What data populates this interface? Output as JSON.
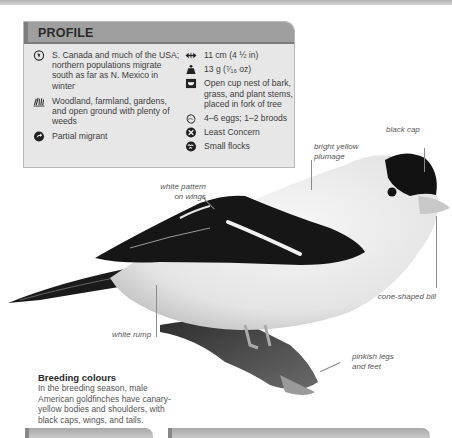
{
  "profile": {
    "title": "PROFILE",
    "left_items": [
      {
        "icon": "globe-range-icon",
        "text": "S. Canada and much of the USA; northern populations migrate south as far as N. Mexico in winter"
      },
      {
        "icon": "grass-habitat-icon",
        "text": "Woodland, farmland, gardens, and open ground with plenty of weeds"
      },
      {
        "icon": "migration-arrow-icon",
        "text": "Partial migrant"
      }
    ],
    "right_items": [
      {
        "icon": "length-arrows-icon",
        "text": "11 cm (4 ½ in)"
      },
      {
        "icon": "weight-icon",
        "text": "13 g (⁷⁄₁₆ oz)"
      },
      {
        "icon": "nest-icon",
        "text": "Open cup nest of bark, grass, and plant stems, placed in fork of tree"
      },
      {
        "icon": "egg-icon",
        "text": "4–6 eggs; 1–2 broods"
      },
      {
        "icon": "conservation-status-icon",
        "text": "Least Concern"
      },
      {
        "icon": "flock-icon",
        "text": "Small flocks"
      }
    ]
  },
  "callouts": {
    "black_cap": "black cap",
    "bright_yellow": "bright yellow plumage",
    "white_pattern": "white pattern on wings",
    "cone_bill": "cone-shaped bill",
    "white_rump": "white rump",
    "pinkish_legs": "pinkish legs and feet"
  },
  "breeding": {
    "title": "Breeding colours",
    "text": "In the breeding season, male American goldfinches have canary-yellow bodies and shoulders, with black caps, wings, and tails."
  },
  "colors": {
    "header_band": "#9f9f9f",
    "box_bg": "#e7e7e7",
    "text": "#3d3d3d"
  }
}
